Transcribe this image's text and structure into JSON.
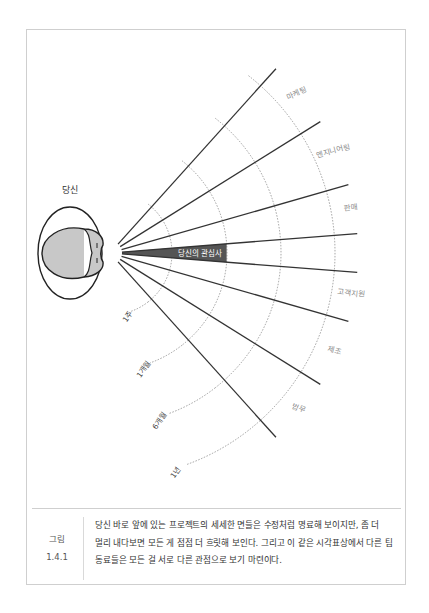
{
  "figure": {
    "you_label": "당신",
    "focus_label": "당신의 관심사",
    "origin": {
      "x": 110,
      "y": 253
    },
    "ray_length": 248,
    "ray_start": 12,
    "ray_angles_deg": [
      -48,
      -32,
      -16,
      -4.5,
      4.5,
      16,
      32,
      48
    ],
    "focus_wedge": {
      "angle_from": -4.5,
      "angle_to": 4.5,
      "radius": 117,
      "color": "#555555"
    },
    "time_arcs": [
      {
        "label": "1주",
        "radius": 62
      },
      {
        "label": "1개월",
        "radius": 117
      },
      {
        "label": "6개월",
        "radius": 171
      },
      {
        "label": "1년",
        "radius": 225
      }
    ],
    "departments": [
      {
        "label": "마케팅",
        "angle": -40
      },
      {
        "label": "엔지니어링",
        "angle": -24
      },
      {
        "label": "판매",
        "angle": -10
      },
      {
        "label": "고객지원",
        "angle": 10
      },
      {
        "label": "제조",
        "angle": 24
      },
      {
        "label": "법무",
        "angle": 40
      }
    ],
    "colors": {
      "ray": "#333333",
      "arc": "#888888",
      "label": "#888888",
      "head_fill": "#c8c8c8",
      "outline": "#222222"
    }
  },
  "caption": {
    "label_line1": "그림",
    "label_line2": "1.4.1",
    "text": "당신 바로 앞에 있는 프로젝트의 세세한 면들은 수정처럼 명료해 보이지만, 좀 더 멀리 내다보면 모든 게 점점 더 흐릿해 보인다. 그리고 이 같은 시각표상에서 다른 팀 동료들은 모든 걸 서로 다른 관점으로 보기 마련이다."
  }
}
